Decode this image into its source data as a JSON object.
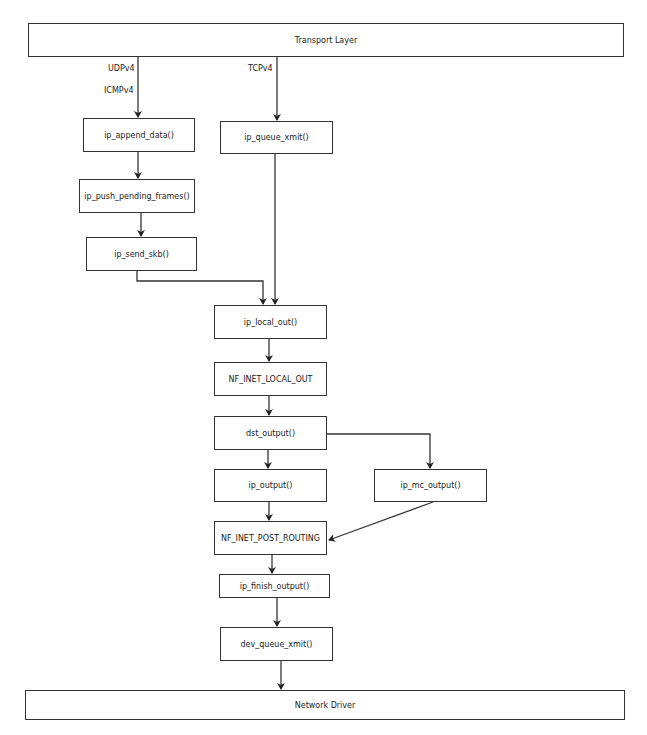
{
  "diagram": {
    "cropped_header_text": "",
    "layers": {
      "top": "Transport Layer",
      "bottom": "Network Driver"
    },
    "protocol_labels": {
      "udp": "UDPv4",
      "icmp": "ICMPv4",
      "tcp": "TCPv4"
    },
    "nodes": {
      "ip_append_data": "ip_append_data()",
      "ip_push_pending_frames": "ip_push_pending_frames()",
      "ip_send_skb": "ip_send_skb()",
      "ip_queue_xmit": "ip_queue_xmit()",
      "ip_local_out": "ip_local_out()",
      "nf_inet_local_out": "NF_INET_LOCAL_OUT",
      "dst_output": "dst_output()",
      "ip_output": "ip_output()",
      "ip_mc_output": "ip_mc_output()",
      "nf_inet_post_routing": "NF_INET_POST_ROUTING",
      "ip_finish_output": "ip_finish_output()",
      "dev_queue_xmit": "dev_queue_xmit()"
    },
    "edges": [
      [
        "Transport Layer",
        "ip_append_data()",
        "UDPv4 / ICMPv4"
      ],
      [
        "Transport Layer",
        "ip_queue_xmit()",
        "TCPv4"
      ],
      [
        "ip_append_data()",
        "ip_push_pending_frames()"
      ],
      [
        "ip_push_pending_frames()",
        "ip_send_skb()"
      ],
      [
        "ip_send_skb()",
        "ip_local_out()"
      ],
      [
        "ip_queue_xmit()",
        "ip_local_out()"
      ],
      [
        "ip_local_out()",
        "NF_INET_LOCAL_OUT"
      ],
      [
        "NF_INET_LOCAL_OUT",
        "dst_output()"
      ],
      [
        "dst_output()",
        "ip_output()"
      ],
      [
        "dst_output()",
        "ip_mc_output()"
      ],
      [
        "ip_output()",
        "NF_INET_POST_ROUTING"
      ],
      [
        "ip_mc_output()",
        "NF_INET_POST_ROUTING"
      ],
      [
        "NF_INET_POST_ROUTING",
        "ip_finish_output()"
      ],
      [
        "ip_finish_output()",
        "dev_queue_xmit()"
      ],
      [
        "dev_queue_xmit()",
        "Network Driver"
      ]
    ],
    "colors": {
      "stroke": "#333333",
      "background": "#ffffff",
      "text": "#222222"
    }
  }
}
